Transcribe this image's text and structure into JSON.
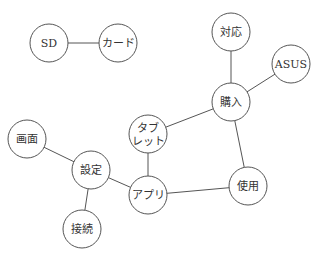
{
  "graph": {
    "radius": 19,
    "nodes": [
      {
        "id": "sd",
        "label": "SD",
        "x": 49,
        "y": 43
      },
      {
        "id": "card",
        "label": "カード",
        "x": 118,
        "y": 43
      },
      {
        "id": "taiou",
        "label": "対応",
        "x": 231,
        "y": 32
      },
      {
        "id": "asus",
        "label": "ASUS",
        "x": 291,
        "y": 64
      },
      {
        "id": "kounyuu",
        "label": "購入",
        "x": 231,
        "y": 102
      },
      {
        "id": "tablet",
        "label": "タブ\nレット",
        "line1": "タブ",
        "line2": "レット",
        "x": 148,
        "y": 134
      },
      {
        "id": "gamen",
        "label": "画面",
        "x": 27,
        "y": 139
      },
      {
        "id": "settei",
        "label": "設定",
        "x": 91,
        "y": 170
      },
      {
        "id": "apuri",
        "label": "アプリ",
        "x": 148,
        "y": 195
      },
      {
        "id": "shiyou",
        "label": "使用",
        "x": 248,
        "y": 186
      },
      {
        "id": "setsuzoku",
        "label": "接続",
        "x": 82,
        "y": 229
      }
    ],
    "edges": [
      [
        "sd",
        "card"
      ],
      [
        "taiou",
        "kounyuu"
      ],
      [
        "asus",
        "kounyuu"
      ],
      [
        "kounyuu",
        "tablet"
      ],
      [
        "kounyuu",
        "shiyou"
      ],
      [
        "tablet",
        "apuri"
      ],
      [
        "gamen",
        "settei"
      ],
      [
        "settei",
        "apuri"
      ],
      [
        "settei",
        "setsuzoku"
      ],
      [
        "apuri",
        "shiyou"
      ]
    ]
  }
}
